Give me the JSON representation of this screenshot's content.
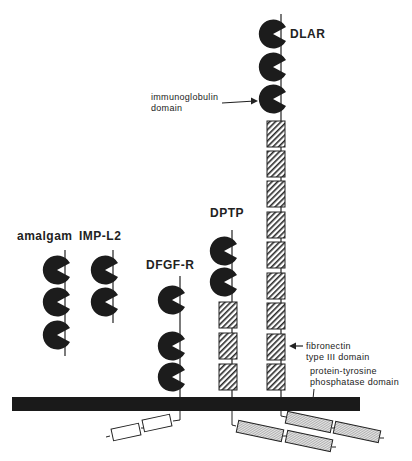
{
  "diagram": {
    "proteins": [
      {
        "name": "amalgam",
        "ig_domains": 3,
        "fn3_domains": 0,
        "transmembrane": false
      },
      {
        "name": "IMP-L2",
        "ig_domains": 2,
        "fn3_domains": 0,
        "transmembrane": false
      },
      {
        "name": "DFGF-R",
        "ig_domains": 3,
        "fn3_domains": 0,
        "transmembrane": true,
        "intracellular_domains": 2
      },
      {
        "name": "DPTP",
        "ig_domains": 2,
        "fn3_domains": 3,
        "transmembrane": true,
        "ptp_domains": 2
      },
      {
        "name": "DLAR",
        "ig_domains": 3,
        "fn3_domains": 9,
        "transmembrane": true,
        "ptp_domains": 2
      }
    ],
    "annotations": {
      "ig_line1": "immunoglobulin",
      "ig_line2": "domain",
      "fn_line1": "fibronectin",
      "fn_line2": "type III domain",
      "ptp_line1": "protein-tyrosine",
      "ptp_line2": "phosphatase domain"
    },
    "colors": {
      "domain_fill": "#1c1c1c",
      "membrane": "#1a1a1a",
      "hatch": "#2a2a2a",
      "ptp_fill": "#d9d9d9"
    }
  }
}
